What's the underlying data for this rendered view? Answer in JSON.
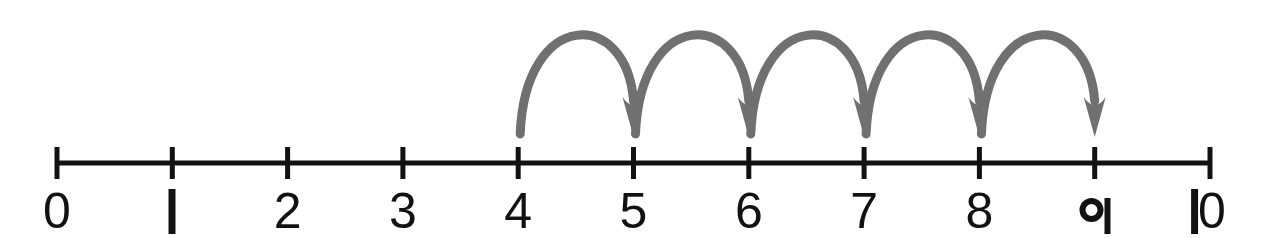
{
  "figure": {
    "background_color": "#ffffff",
    "line_color": "#121212",
    "label_color": "#121212",
    "jump_color": "#707070"
  },
  "number_line": {
    "min": 0,
    "max": 10,
    "step": 1,
    "axis_y": 163,
    "start_x": 57,
    "end_x": 1210,
    "tick_spacing_px": 115.3,
    "tick_half_height": 16,
    "labels": [
      "0",
      "1",
      "2",
      "3",
      "4",
      "5",
      "6",
      "7",
      "8",
      "9",
      "10"
    ],
    "label_values": [
      0,
      1,
      2,
      3,
      4,
      5,
      6,
      7,
      8,
      9,
      10
    ],
    "label_y": 186
  },
  "jumps": {
    "count": 5,
    "size": 1,
    "from": 4,
    "to": 9,
    "arc_peak_y": 44,
    "arrow_tip_y": 137,
    "stroke_width": 9,
    "color": "#707070",
    "arcs": [
      {
        "start": 4,
        "end": 5
      },
      {
        "start": 5,
        "end": 6
      },
      {
        "start": 6,
        "end": 7
      },
      {
        "start": 7,
        "end": 8
      },
      {
        "start": 8,
        "end": 9
      }
    ]
  },
  "chart_data": {
    "type": "line",
    "xlabel": "",
    "ylabel": "",
    "xlim": [
      0,
      10
    ],
    "categories": [
      "0",
      "1",
      "2",
      "3",
      "4",
      "5",
      "6",
      "7",
      "8",
      "9",
      "10"
    ],
    "values": [
      0,
      1,
      2,
      3,
      4,
      5,
      6,
      7,
      8,
      9,
      10
    ],
    "annotations": [
      {
        "label": "jump",
        "from": 4,
        "to": 5
      },
      {
        "label": "jump",
        "from": 5,
        "to": 6
      },
      {
        "label": "jump",
        "from": 6,
        "to": 7
      },
      {
        "label": "jump",
        "from": 7,
        "to": 8
      },
      {
        "label": "jump",
        "from": 8,
        "to": 9
      }
    ],
    "grid": false,
    "legend": "none"
  }
}
